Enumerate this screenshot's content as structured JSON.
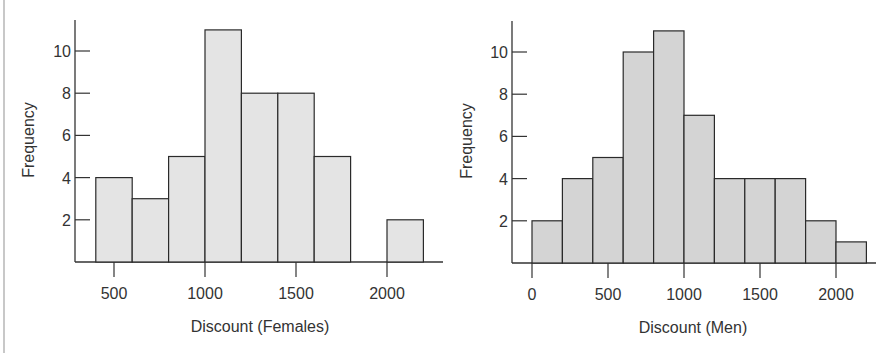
{
  "chart_data": [
    {
      "type": "bar",
      "subtype": "histogram",
      "title": "",
      "xlabel": "Discount (Females)",
      "ylabel": "Frequency",
      "bin_width": 200,
      "bins": [
        {
          "start": 400,
          "end": 600,
          "count": 4
        },
        {
          "start": 600,
          "end": 800,
          "count": 3
        },
        {
          "start": 800,
          "end": 1000,
          "count": 5
        },
        {
          "start": 1000,
          "end": 1200,
          "count": 11
        },
        {
          "start": 1200,
          "end": 1400,
          "count": 8
        },
        {
          "start": 1400,
          "end": 1600,
          "count": 8
        },
        {
          "start": 1600,
          "end": 1800,
          "count": 5
        },
        {
          "start": 1800,
          "end": 2000,
          "count": 0
        },
        {
          "start": 2000,
          "end": 2200,
          "count": 2
        }
      ],
      "categories": [
        "400-600",
        "600-800",
        "800-1000",
        "1000-1200",
        "1200-1400",
        "1400-1600",
        "1600-1800",
        "1800-2000",
        "2000-2200"
      ],
      "values": [
        4,
        3,
        5,
        11,
        8,
        8,
        5,
        0,
        2
      ],
      "x_ticks": [
        500,
        1000,
        1500,
        2000
      ],
      "y_ticks": [
        2,
        4,
        6,
        8,
        10
      ],
      "xlim": [
        390,
        2350
      ],
      "ylim": [
        0,
        11.5
      ],
      "grid": false,
      "legend": null,
      "bar_color": "#e4e4e4"
    },
    {
      "type": "bar",
      "subtype": "histogram",
      "title": "",
      "xlabel": "Discount (Men)",
      "ylabel": "Frequency",
      "bin_width": 200,
      "bins": [
        {
          "start": 0,
          "end": 200,
          "count": 2
        },
        {
          "start": 200,
          "end": 400,
          "count": 4
        },
        {
          "start": 400,
          "end": 600,
          "count": 5
        },
        {
          "start": 600,
          "end": 800,
          "count": 10
        },
        {
          "start": 800,
          "end": 1000,
          "count": 11
        },
        {
          "start": 1000,
          "end": 1200,
          "count": 7
        },
        {
          "start": 1200,
          "end": 1400,
          "count": 4
        },
        {
          "start": 1400,
          "end": 1600,
          "count": 4
        },
        {
          "start": 1600,
          "end": 1800,
          "count": 4
        },
        {
          "start": 1800,
          "end": 2000,
          "count": 2
        },
        {
          "start": 2000,
          "end": 2200,
          "count": 1
        }
      ],
      "categories": [
        "0-200",
        "200-400",
        "400-600",
        "600-800",
        "800-1000",
        "1000-1200",
        "1200-1400",
        "1400-1600",
        "1600-1800",
        "1800-2000",
        "2000-2200"
      ],
      "values": [
        2,
        4,
        5,
        10,
        11,
        7,
        4,
        4,
        4,
        2,
        1
      ],
      "x_ticks": [
        0,
        500,
        1000,
        1500,
        2000
      ],
      "y_ticks": [
        2,
        4,
        6,
        8,
        10
      ],
      "xlim": [
        -130,
        2380
      ],
      "ylim": [
        0,
        11.5
      ],
      "grid": false,
      "legend": null,
      "bar_color": "#d4d4d4"
    }
  ],
  "colors": {
    "axis": "#333333",
    "bar_outline": "#2a2a2a",
    "females_bar": "#e4e4e4",
    "men_bar": "#d4d4d4",
    "page_border": "#c8c8c8"
  }
}
